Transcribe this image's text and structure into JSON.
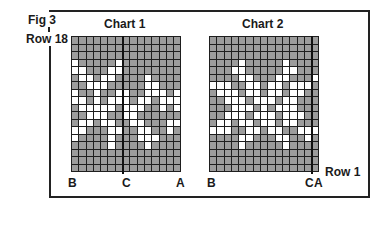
{
  "figure": {
    "label": "Fig 3",
    "row_top_label": "Row 18",
    "row_bottom_label": "Row 1"
  },
  "charts": [
    {
      "title": "Chart 1",
      "columns": 15,
      "rows": 18,
      "divider_after_col": 7,
      "bottom_labels": {
        "left": "B",
        "middle": "C",
        "right": "A"
      },
      "pattern": [
        "ddddddddddddddd",
        "ddddddddddddddd",
        "ddddddddddddddd",
        "wdddddwdddddddd",
        "wwdddwwdddddddd",
        "dwwdwwddddwdddd",
        "ddwwwdddddwwddd",
        "wddwddwwddwwwdw",
        "wwdwdwwwdwwdwww",
        "dwwwwwdwwwddwdw",
        "ddwwwddwwdddddd",
        "dwwdwwddwwdddww",
        "wwdddwwddwwddwd",
        "wddddwdddwwwddd",
        "dddddwddddwdddd",
        "ddddddddddddddd",
        "ddddddddddddddd",
        "ddddddddddddddd"
      ]
    },
    {
      "title": "Chart 2",
      "columns": 15,
      "rows": 18,
      "divider_after_col": 14,
      "bottom_labels": {
        "left": "B",
        "middle": "C",
        "right": "A"
      },
      "pattern": [
        "ddddddddddddddd",
        "ddddddddddddddd",
        "ddddddddddddddd",
        "ddddwdddddwdddd",
        "dddwwdddddwwddd",
        "ddddwwdddwwdddw",
        "wwwddwwdwwdwwwd",
        "dwwwdwwdwwdwwdd",
        "ddwwwdwwwdwwddd",
        "dddwwwdwdwwwddd",
        "ddwwwdwwwdwwwdd",
        "dwwdwwdwwdwwddd",
        "wwwddwwdwwddwww",
        "ddddwwdddwwddw",
        "ddddwdddddwdddd",
        "ddddddddddddddd",
        "ddddddddddddddd",
        "ddddddddddddddd"
      ]
    }
  ]
}
